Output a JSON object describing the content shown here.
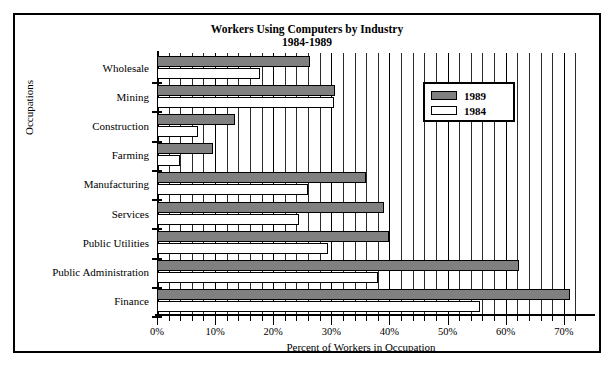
{
  "chart_data": {
    "type": "bar",
    "orientation": "horizontal",
    "title": "Workers Using Computers by Industry",
    "subtitle": "1984-1989",
    "xlabel": "Percent of Workers in Occupation",
    "ylabel": "Occupations",
    "xlim": [
      0,
      70
    ],
    "xticks": [
      0,
      10,
      20,
      30,
      40,
      50,
      60,
      70
    ],
    "xtick_labels": [
      "0%",
      "10%",
      "20%",
      "30%",
      "40%",
      "50%",
      "60%",
      "70%"
    ],
    "minor_tick_step": 2,
    "grid": "vertical",
    "legend_position": "upper right",
    "categories": [
      "Wholesale",
      "Mining",
      "Construction",
      "Farming",
      "Manufacturing",
      "Services",
      "Public Utilities",
      "Public Administration",
      "Finance"
    ],
    "series": [
      {
        "name": "1989",
        "color": "#808080",
        "values": [
          26.3,
          30.7,
          13.4,
          9.6,
          36.0,
          39.0,
          40.0,
          62.3,
          71.0
        ]
      },
      {
        "name": "1984",
        "color": "#ffffff",
        "values": [
          17.7,
          30.5,
          7.0,
          4.0,
          26.0,
          24.5,
          29.4,
          38.0,
          55.6
        ]
      }
    ]
  },
  "legend": {
    "entries": [
      {
        "label": "1989",
        "swatch": "y1989"
      },
      {
        "label": "1984",
        "swatch": "y1984"
      }
    ]
  },
  "colors": {
    "bar_1989": "#808080",
    "bar_1984": "#ffffff",
    "axis": "#000000",
    "background": "#ffffff"
  }
}
